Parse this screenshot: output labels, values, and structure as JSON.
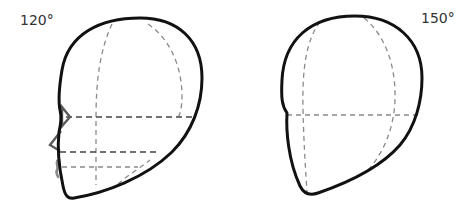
{
  "figure": {
    "heads": [
      {
        "id": "head-120",
        "angle_label": "120°"
      },
      {
        "id": "head-150",
        "angle_label": "150°"
      }
    ]
  },
  "colors": {
    "outline": "#111111",
    "guide": "#8a8a8a",
    "guide_dark": "#444444",
    "feature": "#5a5a5a",
    "background": "#ffffff"
  }
}
